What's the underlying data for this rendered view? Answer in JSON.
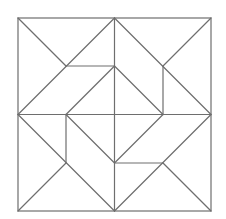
{
  "diagram": {
    "type": "geometric-quilt-pattern",
    "canvas": {
      "width": 226,
      "height": 219,
      "background": "#ffffff"
    },
    "stroke_color": "#6e6e6e",
    "outer_square": {
      "x": 18,
      "y": 18,
      "size": 193
    },
    "lines": [
      {
        "id": "center-vertical",
        "x1": 114.5,
        "y1": 18,
        "x2": 114.5,
        "y2": 211
      },
      {
        "id": "center-horizontal",
        "x1": 18,
        "y1": 114.5,
        "x2": 211,
        "y2": 114.5
      },
      {
        "id": "tl-corner-diagonal",
        "x1": 18,
        "y1": 18,
        "x2": 66,
        "y2": 66
      },
      {
        "id": "tl-long-diagonal",
        "x1": 114.5,
        "y1": 18,
        "x2": 18,
        "y2": 114.5
      },
      {
        "id": "tl-horizontal",
        "x1": 66,
        "y1": 66,
        "x2": 114.5,
        "y2": 66
      },
      {
        "id": "tl-parallel",
        "x1": 114.5,
        "y1": 66,
        "x2": 66,
        "y2": 114.5
      },
      {
        "id": "tr-long-diagonal",
        "x1": 114.5,
        "y1": 18,
        "x2": 211,
        "y2": 114.5
      },
      {
        "id": "tr-corner-diagonal",
        "x1": 163,
        "y1": 66,
        "x2": 211,
        "y2": 18
      },
      {
        "id": "tr-vertical",
        "x1": 163,
        "y1": 66,
        "x2": 163,
        "y2": 114.5
      },
      {
        "id": "tr-parallel",
        "x1": 114.5,
        "y1": 66,
        "x2": 163,
        "y2": 114.5
      },
      {
        "id": "bl-long-diagonal",
        "x1": 18,
        "y1": 114.5,
        "x2": 114.5,
        "y2": 211
      },
      {
        "id": "bl-corner-diagonal",
        "x1": 66,
        "y1": 163,
        "x2": 18,
        "y2": 211
      },
      {
        "id": "bl-vertical",
        "x1": 66,
        "y1": 114.5,
        "x2": 66,
        "y2": 163
      },
      {
        "id": "bl-parallel",
        "x1": 66,
        "y1": 114.5,
        "x2": 114.5,
        "y2": 163
      },
      {
        "id": "br-parallel",
        "x1": 163,
        "y1": 114.5,
        "x2": 114.5,
        "y2": 163
      },
      {
        "id": "br-horizontal",
        "x1": 114.5,
        "y1": 163,
        "x2": 163,
        "y2": 163
      },
      {
        "id": "br-long-diagonal",
        "x1": 211,
        "y1": 114.5,
        "x2": 114.5,
        "y2": 211
      },
      {
        "id": "br-corner-diagonal",
        "x1": 163,
        "y1": 163,
        "x2": 211,
        "y2": 211
      }
    ]
  }
}
